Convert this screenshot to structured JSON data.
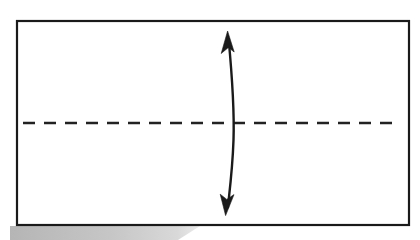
{
  "figure": {
    "background_color": "#ffffff",
    "ink_color": "#1a1a1a",
    "canvas": {
      "width": 420,
      "height": 240
    }
  },
  "shapes": {
    "rectangle": {
      "name": "outer rectangle",
      "x": 17,
      "y": 21,
      "width": 392,
      "height": 204,
      "stroke_color": "#1a1a1a",
      "stroke_width": 2.2,
      "fill": "none"
    },
    "centerline": {
      "name": "horizontal dashed centerline",
      "x1": 23,
      "y1": 123,
      "x2": 395,
      "y2": 123,
      "stroke_color": "#222222",
      "stroke_width": 2.4,
      "dash_length": 12,
      "gap_length": 9,
      "dash_pattern": "12 9"
    },
    "dimension_arrow": {
      "name": "curved double-headed vertical arrow",
      "path": "M 228.5 38 C 232.5 80 234.5 110 233.5 140 C 232.6 168 229.5 192 227.8 208",
      "stroke_color": "#1a1a1a",
      "stroke_width": 2.4,
      "top_tip": {
        "x": 228,
        "y": 31
      },
      "bottom_tip": {
        "x": 227,
        "y": 215
      },
      "crossing_point": {
        "x": 233,
        "y": 123
      },
      "head_style": "solid-narrow-triangle",
      "head_length": 19,
      "head_half_width": 6.5,
      "heads": "both"
    },
    "scan_shadow": {
      "name": "gray scanner shadow below bottom edge",
      "color": "#b8b8b8",
      "x_start": 10,
      "x_end": 200,
      "y_top": 226,
      "y_bottom": 240,
      "taper": "diagonal"
    }
  },
  "annotations": {
    "labels": [],
    "text_present": false
  }
}
